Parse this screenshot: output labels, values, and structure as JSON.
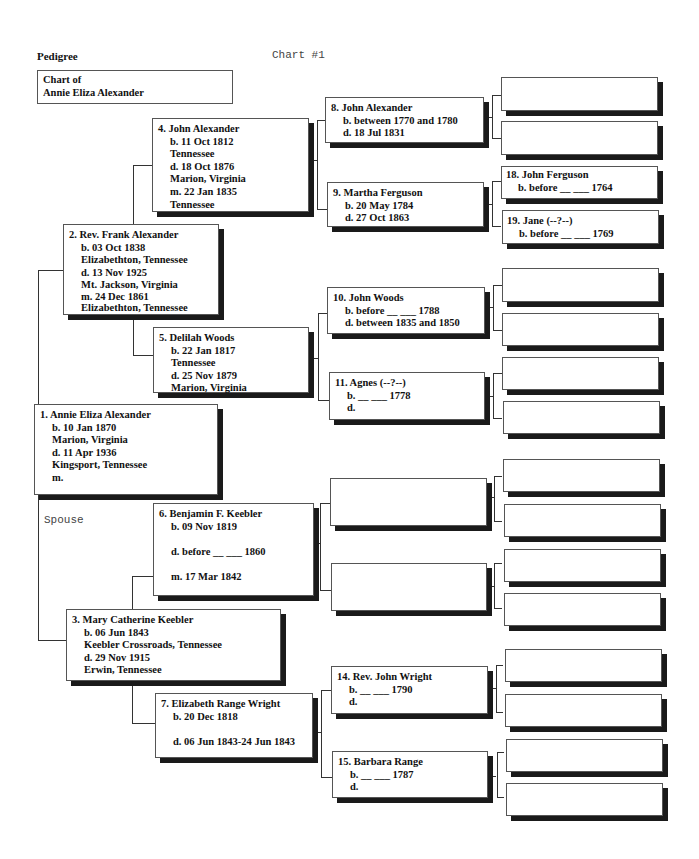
{
  "header": {
    "title": "Pedigree",
    "chart_number": "Chart #1"
  },
  "chart_of": {
    "label": "Chart of",
    "name": "Annie Eliza Alexander"
  },
  "spouse_label": "Spouse",
  "people": {
    "p1": {
      "name": "1. Annie Eliza Alexander",
      "lines": [
        "b. 10 Jan 1870",
        "Marion, Virginia",
        "d. 11 Apr 1936",
        "Kingsport, Tennessee",
        "m."
      ]
    },
    "p2": {
      "name": "2. Rev. Frank Alexander",
      "lines": [
        "b. 03 Oct 1838",
        "Elizabethton, Tennessee",
        "d. 13 Nov 1925",
        "Mt. Jackson, Virginia",
        "m. 24 Dec 1861",
        "Elizabethton, Tennessee"
      ]
    },
    "p3": {
      "name": "3. Mary Catherine Keebler",
      "lines": [
        "b. 06 Jun 1843",
        "Keebler Crossroads, Tennessee",
        "d. 29 Nov 1915",
        "Erwin, Tennessee"
      ]
    },
    "p4": {
      "name": "4. John Alexander",
      "lines": [
        "b. 11 Oct 1812",
        "Tennessee",
        "d. 18 Oct 1876",
        "Marion, Virginia",
        "m. 22 Jan 1835",
        "Tennessee"
      ]
    },
    "p5": {
      "name": "5. Delilah Woods",
      "lines": [
        "b. 22 Jan 1817",
        "Tennessee",
        "d. 25 Nov 1879",
        "Marion, Virginia"
      ]
    },
    "p6": {
      "name": "6. Benjamin F. Keebler",
      "lines": [
        "b. 09 Nov 1819",
        "d. before __ ___ 1860",
        "m. 17 Mar 1842"
      ]
    },
    "p7": {
      "name": "7. Elizabeth Range Wright",
      "lines": [
        "b. 20 Dec 1818",
        "d. 06 Jun 1843-24 Jun 1843"
      ]
    },
    "p8": {
      "name": "8. John Alexander",
      "lines": [
        "b. between 1770 and 1780",
        "d. 18 Jul 1831"
      ]
    },
    "p9": {
      "name": "9. Martha Ferguson",
      "lines": [
        "b. 20 May 1784",
        "d. 27 Oct 1863"
      ]
    },
    "p10": {
      "name": "10. John Woods",
      "lines": [
        "b. before __ ___ 1788",
        "d. between 1835 and 1850"
      ]
    },
    "p11": {
      "name": "11. Agnes (--?--)",
      "lines": [
        "b. __ ___ 1778",
        "d."
      ]
    },
    "p14": {
      "name": "14. Rev. John Wright",
      "lines": [
        "b. __ ___ 1790",
        "d."
      ]
    },
    "p15": {
      "name": "15. Barbara Range",
      "lines": [
        "b. __ ___ 1787",
        "d."
      ]
    },
    "p18": {
      "name": "18. John Ferguson",
      "lines": [
        "b. before __ ___ 1764"
      ]
    },
    "p19": {
      "name": "19. Jane (--?--)",
      "lines": [
        "b. before __ ___ 1769"
      ]
    }
  }
}
